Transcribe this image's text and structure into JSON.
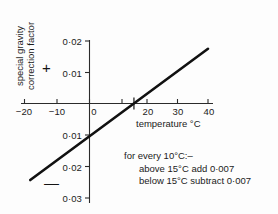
{
  "chart_data": {
    "type": "line",
    "title": "",
    "xlabel": "temperature °C",
    "ylabel": "special gravity correction factor",
    "xlim": [
      -20,
      40
    ],
    "ylim": [
      -0.03,
      0.02
    ],
    "grid": false,
    "legend": "none",
    "x_ticks": [
      {
        "value": -20,
        "label": "−20"
      },
      {
        "value": -10,
        "label": "−10"
      },
      {
        "value": 0,
        "label": "0"
      },
      {
        "value": 10,
        "label": ""
      },
      {
        "value": 20,
        "label": "20"
      },
      {
        "value": 30,
        "label": "30"
      },
      {
        "value": 40,
        "label": "40"
      }
    ],
    "y_ticks": [
      {
        "value": 0.02,
        "label": "0·02"
      },
      {
        "value": 0.01,
        "label": "0·01"
      },
      {
        "value": 0,
        "label": ""
      },
      {
        "value": -0.01,
        "label": "0·01"
      },
      {
        "value": -0.02,
        "label": "0·02"
      },
      {
        "value": -0.03,
        "label": "0·03"
      }
    ],
    "series": [
      {
        "name": "correction factor",
        "x": [
          -20,
          40
        ],
        "values": [
          -0.0245,
          0.0175
        ],
        "zero_crossing_x": 15,
        "slope_per_degC": 0.0007
      }
    ],
    "annotations": {
      "positive_sign": "+",
      "negative_sign": "−",
      "zero_crossing_marker": "cross at 15 °C"
    }
  },
  "axes": {
    "y_title_line1": "special gravity",
    "y_title_line2": "correction factor",
    "x_title": "temperature °C"
  },
  "note": {
    "line1": "for every 10°C:–",
    "line2": "above 15°C add 0·007",
    "line3": "below 15°C subtract 0·007"
  },
  "signs": {
    "plus": "+",
    "minus": "—"
  },
  "colors": {
    "ink": "#1a1a1a",
    "axis": "#2b2b2b",
    "line": "#111111",
    "background": "#fdfdfd"
  }
}
